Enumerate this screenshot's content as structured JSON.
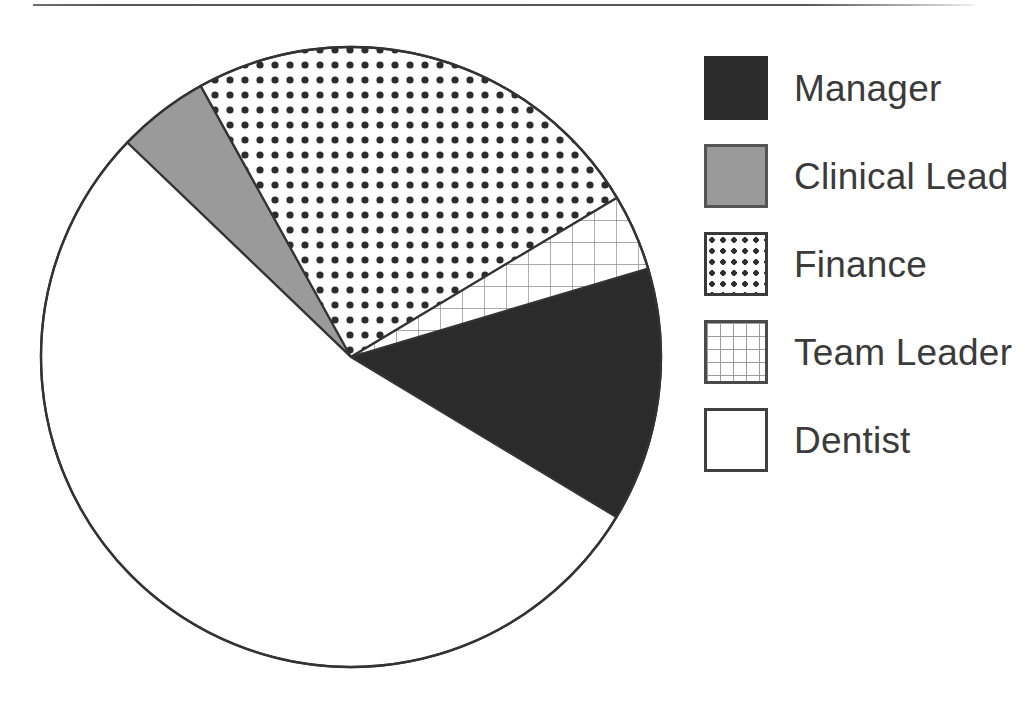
{
  "chart_data": {
    "type": "pie",
    "title": "",
    "subtitle": "",
    "xlabel": "",
    "ylabel": "",
    "legend_position": "right",
    "grid": false,
    "start_angle_deg_clockwise_from_top": 73.4,
    "categories": [
      "Manager",
      "Clinical Lead",
      "Finance",
      "Team Leader",
      "Dentist"
    ],
    "values": [
      13.2,
      4.8,
      24.5,
      4.0,
      53.5
    ],
    "slices": [
      {
        "label": "Manager",
        "value": 13.2,
        "angle_deg": 47.7,
        "start_deg": 73.4,
        "end_deg": 121.1,
        "fill": "solid-dark",
        "color": "#2b2b2b"
      },
      {
        "label": "Clinical Lead",
        "value": 4.8,
        "angle_deg": 17.2,
        "start_deg": 313.8,
        "end_deg": 331.0,
        "fill": "gray",
        "color": "#9a9a9a"
      },
      {
        "label": "Finance",
        "value": 24.5,
        "angle_deg": 88.1,
        "start_deg": 331.0,
        "end_deg": 59.1,
        "fill": "dotted",
        "color": "#ffffff"
      },
      {
        "label": "Team Leader",
        "value": 4.0,
        "angle_deg": 14.3,
        "start_deg": 59.1,
        "end_deg": 73.4,
        "fill": "grid",
        "color": "#ffffff"
      },
      {
        "label": "Dentist",
        "value": 53.5,
        "angle_deg": 192.7,
        "start_deg": 121.1,
        "end_deg": 313.8,
        "fill": "blank",
        "color": "#ffffff"
      }
    ],
    "geometry": {
      "center_x": 351,
      "center_y": 357,
      "radius": 310,
      "outline_color": "#333333"
    }
  },
  "legend": {
    "items": [
      {
        "label": "Manager",
        "swatch": "solid-dark",
        "icon": "legend-swatch-solid-icon"
      },
      {
        "label": "Clinical Lead",
        "swatch": "gray",
        "icon": "legend-swatch-gray-icon"
      },
      {
        "label": "Finance",
        "swatch": "dotted",
        "icon": "legend-swatch-dotted-icon"
      },
      {
        "label": "Team Leader",
        "swatch": "grid",
        "icon": "legend-swatch-grid-icon"
      },
      {
        "label": "Dentist",
        "swatch": "blank",
        "icon": "legend-swatch-blank-icon"
      }
    ]
  },
  "figure": {
    "top_rule": true
  }
}
